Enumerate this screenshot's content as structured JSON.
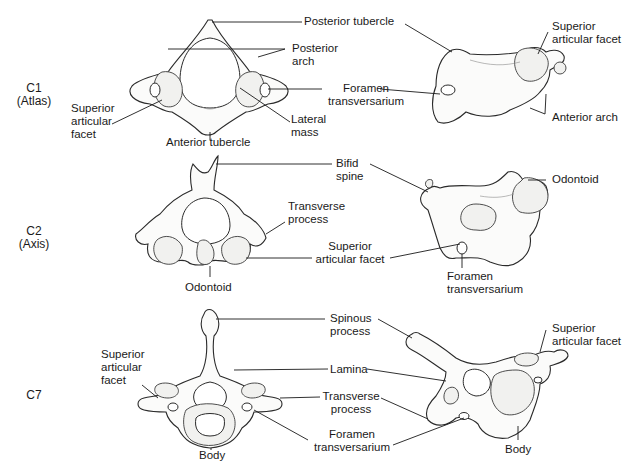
{
  "diagram": {
    "rows": [
      {
        "id": "C1",
        "level": "C1",
        "name": "(Atlas)",
        "labels": {
          "posterior_tubercle": "Posterior tubercle",
          "posterior_arch_1": "Posterior",
          "posterior_arch_2": "arch",
          "foramen_1": "Foramen",
          "foramen_2": "transversarium",
          "superior_facet_1": "Superior",
          "superior_facet_2": "articular",
          "superior_facet_3": "facet",
          "lateral_mass_1": "Lateral",
          "lateral_mass_2": "mass",
          "anterior_tubercle": "Anterior tubercle",
          "side_superior_facet_1": "Superior",
          "side_superior_facet_2": "articular facet",
          "anterior_arch": "Anterior arch"
        }
      },
      {
        "id": "C2",
        "level": "C2",
        "name": "(Axis)",
        "labels": {
          "bifid_spine_1": "Bifid",
          "bifid_spine_2": "spine",
          "transverse_1": "Transverse",
          "transverse_2": "process",
          "superior_facet_1": "Superior",
          "superior_facet_2": "articular facet",
          "odontoid_top": "Odontoid",
          "foramen_1": "Foramen",
          "foramen_2": "transversarium",
          "odontoid_side": "Odontoid"
        }
      },
      {
        "id": "C7",
        "level": "C7",
        "name": "",
        "labels": {
          "spinous_1": "Spinous",
          "spinous_2": "process",
          "lamina": "Lamina",
          "transverse_1": "Transverse",
          "transverse_2": "process",
          "foramen_1": "Foramen",
          "foramen_2": "transversarium",
          "superior_facet_1": "Superior",
          "superior_facet_2": "articular",
          "superior_facet_3": "facet",
          "body_top": "Body",
          "side_superior_facet_1": "Superior",
          "side_superior_facet_2": "articular facet",
          "body_side": "Body"
        }
      }
    ]
  }
}
